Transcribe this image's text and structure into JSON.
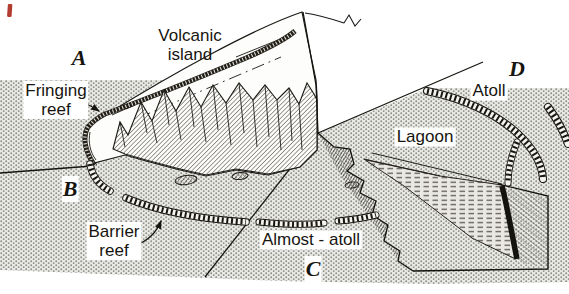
{
  "diagram": {
    "stage_labels": {
      "a": "A",
      "b": "B",
      "c": "C",
      "d": "D"
    },
    "feature_labels": {
      "volcanic_island": "Volcanic\nisland",
      "fringing_reef": "Fringing\nreef",
      "barrier_reef": "Barrier\nreef",
      "almost_atoll": "Almost - atoll",
      "atoll": "Atoll",
      "lagoon": "Lagoon"
    },
    "colors": {
      "ink": "#17150f",
      "sea_fill": "#e9e9e5",
      "sea_dot": "#8e8e88",
      "page": "#ffffff",
      "red_mark": "#b23c30"
    }
  }
}
